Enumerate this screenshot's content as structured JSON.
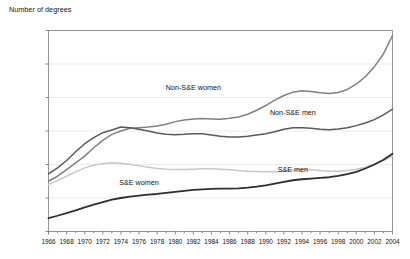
{
  "chart_data": {
    "type": "line",
    "title": "Number of degrees",
    "xlabel": "",
    "ylabel": "Number of degrees",
    "ylim": [
      0,
      600000
    ],
    "xlim": [
      1966,
      2004
    ],
    "grid": true,
    "legend_position": "inline-annotations",
    "y_ticks": [
      "0",
      "100,000",
      "200,000",
      "300,000",
      "400,000",
      "500,000",
      "600,000"
    ],
    "y_tick_values": [
      0,
      100000,
      200000,
      300000,
      400000,
      500000,
      600000
    ],
    "x_ticks": [
      "1966",
      "1968",
      "1970",
      "1972",
      "1974",
      "1976",
      "1978",
      "1980",
      "1982",
      "1984",
      "1986",
      "1988",
      "1990",
      "1992",
      "1994",
      "1996",
      "1998",
      "2000",
      "2002",
      "2004"
    ],
    "x_tick_values": [
      1966,
      1968,
      1970,
      1972,
      1974,
      1976,
      1978,
      1980,
      1982,
      1984,
      1986,
      1988,
      1990,
      1992,
      1994,
      1996,
      1998,
      2000,
      2002,
      2004
    ],
    "x": [
      1966,
      1967,
      1968,
      1969,
      1970,
      1971,
      1972,
      1973,
      1974,
      1975,
      1976,
      1977,
      1978,
      1979,
      1980,
      1981,
      1982,
      1983,
      1984,
      1985,
      1986,
      1987,
      1988,
      1989,
      1990,
      1991,
      1992,
      1993,
      1994,
      1995,
      1996,
      1997,
      1998,
      1999,
      2000,
      2001,
      2002,
      2003,
      2004
    ],
    "series": [
      {
        "name": "Non-S&E women",
        "color": "#808080",
        "width": 1.5,
        "label_x": 1982,
        "label_y": 432000,
        "values": [
          150000,
          165000,
          185000,
          205000,
          225000,
          250000,
          272000,
          290000,
          300000,
          308000,
          310000,
          312000,
          315000,
          320000,
          328000,
          333000,
          336000,
          337000,
          336000,
          335000,
          338000,
          342000,
          350000,
          362000,
          376000,
          392000,
          406000,
          416000,
          420000,
          418000,
          414000,
          412000,
          415000,
          424000,
          440000,
          462000,
          492000,
          530000,
          585000
        ]
      },
      {
        "name": "Non-S&E men",
        "color": "#595959",
        "width": 1.5,
        "label_x": 1993,
        "label_y": 356000,
        "values": [
          172000,
          190000,
          212000,
          238000,
          262000,
          280000,
          295000,
          303000,
          312000,
          310000,
          305000,
          300000,
          294000,
          290000,
          289000,
          290000,
          292000,
          292000,
          288000,
          284000,
          282000,
          282000,
          284000,
          288000,
          292000,
          298000,
          305000,
          310000,
          310000,
          308000,
          305000,
          304000,
          306000,
          310000,
          316000,
          324000,
          334000,
          348000,
          365000
        ]
      },
      {
        "name": "S&E men",
        "color": "#c8c8c8",
        "width": 1.5,
        "label_x": 1993,
        "label_y": 186000,
        "values": [
          140000,
          152000,
          165000,
          178000,
          190000,
          198000,
          203000,
          205000,
          204000,
          200000,
          196000,
          192000,
          188000,
          186000,
          185000,
          185000,
          186000,
          187000,
          187000,
          186000,
          184000,
          182000,
          180000,
          179000,
          178000,
          178000,
          180000,
          183000,
          185000,
          184000,
          182000,
          180000,
          180000,
          182000,
          186000,
          192000,
          200000,
          212000,
          226000
        ]
      },
      {
        "name": "S&E women",
        "color": "#2e2e2e",
        "width": 1.8,
        "label_x": 1976,
        "label_y": 147000,
        "values": [
          40000,
          47000,
          55000,
          63000,
          72000,
          80000,
          88000,
          95000,
          100000,
          104000,
          107000,
          110000,
          112000,
          115000,
          118000,
          121000,
          124000,
          126000,
          127000,
          128000,
          128000,
          129000,
          131000,
          134000,
          138000,
          143000,
          148000,
          153000,
          156000,
          158000,
          160000,
          162000,
          166000,
          171000,
          178000,
          188000,
          200000,
          214000,
          232000
        ]
      }
    ]
  }
}
